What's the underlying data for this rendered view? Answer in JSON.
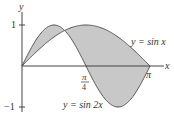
{
  "chart_data": {
    "type": "area",
    "title": "",
    "xlabel": "x",
    "ylabel": "y",
    "xlim": [
      0,
      3.14159
    ],
    "ylim": [
      -1,
      1
    ],
    "grid": false,
    "legend": "inline labels",
    "series": [
      {
        "name": "y = sin x",
        "function": "sin(x)",
        "x": [
          0,
          0.785,
          1.047,
          1.571,
          2.356,
          3.142
        ],
        "values": [
          0,
          0.707,
          0.866,
          1,
          0.707,
          0
        ]
      },
      {
        "name": "y = sin 2x",
        "function": "sin(2x)",
        "x": [
          0,
          0.785,
          1.047,
          1.571,
          2.356,
          3.142
        ],
        "values": [
          0,
          1,
          0.866,
          0,
          -1,
          0
        ]
      }
    ],
    "shaded_region": "area between y = sin x and y = sin 2x for 0 ≤ x ≤ π",
    "annotations": {
      "x_ticks": [
        {
          "label_num": "π",
          "label_den": "4"
        },
        {
          "label": "π"
        }
      ],
      "y_ticks": [
        {
          "label": "1"
        },
        {
          "label": "−1"
        }
      ]
    }
  },
  "labels": {
    "y_axis": "y",
    "x_axis": "x",
    "y_tick_pos": "1",
    "y_tick_neg": "−1",
    "x_tick_mid_num": "π",
    "x_tick_mid_den": "4",
    "x_tick_end": "π",
    "curve1": "y = sin x",
    "curve2": "y = sin 2x"
  },
  "colors": {
    "fill": "#c8c8c8",
    "stroke": "#555555",
    "axis": "#444444"
  }
}
